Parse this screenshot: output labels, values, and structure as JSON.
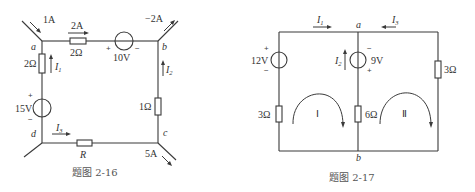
{
  "fig16": {
    "caption": "题图 2-16",
    "nodes": {
      "a": "a",
      "b": "b",
      "c": "c",
      "d": "d"
    },
    "currents": {
      "in_a": "1A",
      "top": "2A",
      "out_b": "−2A",
      "out_c": "5A",
      "I1": "I",
      "I1_sub": "1",
      "I2": "I",
      "I2_sub": "2",
      "I3": "I",
      "I3_sub": "3"
    },
    "components": {
      "r_top": "2Ω",
      "r_left": "2Ω",
      "r_right": "1Ω",
      "r_bottom": "R",
      "v_top": "10V",
      "v_left": "15V"
    },
    "signs": {
      "plus": "+",
      "minus": "−"
    }
  },
  "fig17": {
    "caption": "题图 2-17",
    "nodes": {
      "a": "a",
      "b": "b"
    },
    "currents": {
      "I1": "I",
      "I1_sub": "1",
      "I2": "I",
      "I2_sub": "2",
      "I3": "I",
      "I3_sub": "3"
    },
    "components": {
      "v_left": "12V",
      "v_mid": "9V",
      "r_left": "3Ω",
      "r_mid": "6Ω",
      "r_right": "3Ω"
    },
    "loops": {
      "loop1": "Ⅰ",
      "loop2": "Ⅱ"
    },
    "signs": {
      "plus": "+",
      "minus": "−"
    }
  }
}
